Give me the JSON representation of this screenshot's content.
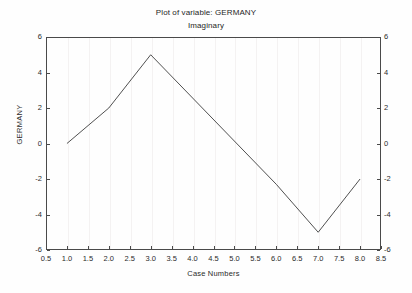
{
  "chart_data": {
    "type": "line",
    "title": "Plot of variable: GERMANY",
    "subtitle": "Imaginary",
    "xlabel": "Case Numbers",
    "ylabel": "GERMANY",
    "xlim": [
      0.5,
      8.5
    ],
    "ylim": [
      -6,
      6
    ],
    "grid": true,
    "grid_axis": "x",
    "legend": "none",
    "line_color": "#3c3c3c",
    "x": [
      1.0,
      2.0,
      3.0,
      6.0,
      7.0,
      8.0
    ],
    "values": [
      0.0,
      2.0,
      5.0,
      -2.3,
      -5.0,
      -2.0
    ],
    "series": [
      {
        "name": "GERMANY",
        "x": [
          1.0,
          2.0,
          3.0,
          6.0,
          7.0,
          8.0
        ],
        "values": [
          0.0,
          2.0,
          5.0,
          -2.3,
          -5.0,
          -2.0
        ]
      }
    ],
    "xticks": [
      0.5,
      1.0,
      1.5,
      2.0,
      2.5,
      3.0,
      3.5,
      4.0,
      4.5,
      5.0,
      5.5,
      6.0,
      6.5,
      7.0,
      7.5,
      8.0,
      8.5
    ],
    "xtick_labels": [
      "0.5",
      "1.0",
      "1.5",
      "2.0",
      "2.5",
      "3.0",
      "3.5",
      "4.0",
      "4.5",
      "5.0",
      "5.5",
      "6.0",
      "6.5",
      "7.0",
      "7.5",
      "8.0",
      "8.5"
    ],
    "yticks": [
      6,
      4,
      2,
      0,
      -2,
      -4,
      -6
    ],
    "ytick_labels": [
      "6",
      "4",
      "2",
      "0",
      "-2",
      "-4",
      "-6"
    ],
    "ytick_labels_right": [
      "6",
      "4",
      "2",
      "0",
      "-2",
      "-4",
      "-6"
    ],
    "right_axis": true
  },
  "figure": {
    "background": "#fefefe",
    "frame_color": "#4a4a4a",
    "gridline_color": "#f4f2f2"
  }
}
